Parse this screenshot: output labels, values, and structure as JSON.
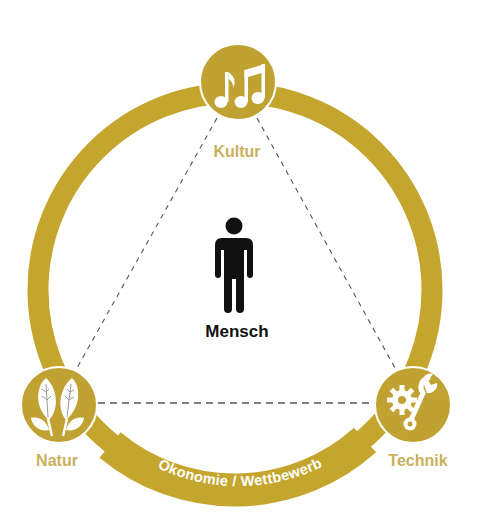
{
  "diagram": {
    "center": {
      "label": "Mensch",
      "icon": "person-icon"
    },
    "nodes": [
      {
        "id": "kultur",
        "label": "Kultur",
        "icon": "music-notes-icon"
      },
      {
        "id": "natur",
        "label": "Natur",
        "icon": "leaves-icon"
      },
      {
        "id": "technik",
        "label": "Technik",
        "icon": "gear-wrench-icon"
      }
    ],
    "ring_label": "Ökonomie / Wettbewerb",
    "edges": [
      {
        "from": "kultur",
        "to": "natur",
        "style": "dashed"
      },
      {
        "from": "kultur",
        "to": "technik",
        "style": "dashed"
      },
      {
        "from": "natur",
        "to": "technik",
        "style": "dashed"
      }
    ],
    "colors": {
      "ring": "#c4a52e",
      "node_fill": "#c0a232",
      "label_gold": "#c8b15a",
      "icon": "#ffffff",
      "person": "#111111",
      "dash": "#555555"
    }
  }
}
